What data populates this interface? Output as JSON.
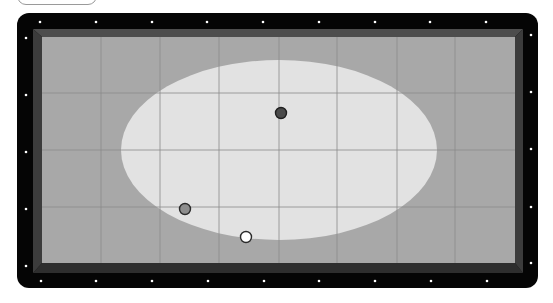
{
  "game": {
    "type": "billiards-table",
    "top_button": {
      "label": ""
    },
    "colors": {
      "frame": "#050505",
      "cushion_top": "#4d4d4d",
      "cushion_side": "#3c3c3c",
      "cushion_bottom": "#2e2e2e",
      "playfield": "#a8a8a8",
      "highlight_ellipse": "#e2e2e2",
      "grid_line": "#8c8c8c",
      "sight_dot": "#ffffff"
    },
    "frame": {
      "x": 17,
      "y": 13,
      "width": 521,
      "height": 275,
      "radius": 12
    },
    "playfield": {
      "x": 42,
      "y": 37,
      "width": 473,
      "height": 226
    },
    "ellipse": {
      "cx": 279,
      "cy": 150,
      "rx": 158,
      "ry": 90
    },
    "grid": {
      "vertical_x": [
        101,
        160,
        219,
        279,
        337,
        397,
        455
      ],
      "horizontal_y": [
        93,
        150,
        207
      ]
    },
    "sights": {
      "top": [
        [
          40,
          22
        ],
        [
          96,
          22
        ],
        [
          152,
          22
        ],
        [
          207,
          22
        ],
        [
          263,
          22
        ],
        [
          319,
          22
        ],
        [
          375,
          22
        ],
        [
          430,
          22
        ],
        [
          486,
          22
        ]
      ],
      "bottom": [
        [
          41,
          281
        ],
        [
          96,
          281
        ],
        [
          152,
          281
        ],
        [
          208,
          281
        ],
        [
          264,
          281
        ],
        [
          319,
          281
        ],
        [
          375,
          281
        ],
        [
          431,
          281
        ],
        [
          487,
          281
        ]
      ],
      "left": [
        [
          26,
          38
        ],
        [
          26,
          95
        ],
        [
          26,
          152
        ],
        [
          26,
          209
        ],
        [
          26,
          266
        ]
      ],
      "right": [
        [
          531,
          35
        ],
        [
          531,
          92
        ],
        [
          531,
          149
        ],
        [
          531,
          207
        ],
        [
          531,
          263
        ]
      ]
    },
    "balls": [
      {
        "name": "dark-ball",
        "cx": 281,
        "cy": 113,
        "r": 5.5,
        "fill": "#4a4a4a",
        "stroke": "#1e1e1e"
      },
      {
        "name": "gray-ball",
        "cx": 185,
        "cy": 209,
        "r": 5.5,
        "fill": "#8d8d8d",
        "stroke": "#2a2a2a"
      },
      {
        "name": "cue-ball",
        "cx": 246,
        "cy": 237,
        "r": 5.5,
        "fill": "#ffffff",
        "stroke": "#2a2a2a"
      }
    ]
  }
}
